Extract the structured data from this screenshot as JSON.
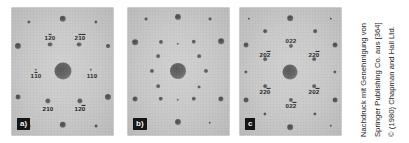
{
  "figure": {
    "background_color": "#ffffff",
    "panel_background_color": "#c8c8c8",
    "spot_color": "#4a4a4a",
    "label_color": "#151515",
    "panels": [
      {
        "id": "a",
        "tag": "a)",
        "caption_letter": "a",
        "has_labels": true,
        "labels": [
          {
            "text": "120",
            "overbar": "1",
            "x": 38,
            "y": 30
          },
          {
            "text": "210",
            "overbar": "21",
            "x": 68,
            "y": 30
          },
          {
            "text": "110",
            "overbar": "1",
            "x": 24,
            "y": 68
          },
          {
            "text": "110",
            "overbar": "",
            "x": 80,
            "y": 68
          },
          {
            "text": "210",
            "overbar": "",
            "x": 36,
            "y": 101
          },
          {
            "text": "120",
            "overbar": "2",
            "x": 68,
            "y": 101
          }
        ],
        "spots": [
          {
            "x": 50.5,
            "y": 63,
            "r": 8.5,
            "central": true
          },
          {
            "x": 17,
            "y": 14,
            "r": 1.6
          },
          {
            "x": 50.5,
            "y": 11,
            "r": 3.2
          },
          {
            "x": 84,
            "y": 14,
            "r": 1.6
          },
          {
            "x": 6,
            "y": 38,
            "r": 3.0
          },
          {
            "x": 38,
            "y": 36.5,
            "r": 2.4
          },
          {
            "x": 67,
            "y": 36.5,
            "r": 2.4
          },
          {
            "x": 96,
            "y": 38,
            "r": 1.9
          },
          {
            "x": 24,
            "y": 62,
            "r": 1.2
          },
          {
            "x": 79,
            "y": 62,
            "r": 1.2
          },
          {
            "x": 6,
            "y": 89,
            "r": 2.4
          },
          {
            "x": 36,
            "y": 93,
            "r": 2.6
          },
          {
            "x": 68,
            "y": 93,
            "r": 2.6
          },
          {
            "x": 96,
            "y": 89,
            "r": 3.0
          },
          {
            "x": 17,
            "y": 118,
            "r": 1.4
          },
          {
            "x": 50.5,
            "y": 117,
            "r": 3.2
          },
          {
            "x": 84,
            "y": 118,
            "r": 1.4
          }
        ]
      },
      {
        "id": "b",
        "tag": "b)",
        "caption_letter": "b",
        "has_labels": false,
        "labels": [],
        "spots": [
          {
            "x": 50,
            "y": 63,
            "r": 8.0,
            "central": true
          },
          {
            "x": 18,
            "y": 11,
            "r": 1.4
          },
          {
            "x": 50,
            "y": 9,
            "r": 3.0
          },
          {
            "x": 82,
            "y": 11,
            "r": 1.4
          },
          {
            "x": 7,
            "y": 34,
            "r": 2.8
          },
          {
            "x": 33,
            "y": 34,
            "r": 2.0
          },
          {
            "x": 50,
            "y": 36,
            "r": 1.2
          },
          {
            "x": 66,
            "y": 34,
            "r": 2.2
          },
          {
            "x": 93,
            "y": 33,
            "r": 2.8
          },
          {
            "x": 30,
            "y": 48,
            "r": 1.8
          },
          {
            "x": 71,
            "y": 48,
            "r": 1.8
          },
          {
            "x": 24,
            "y": 63,
            "r": 2.0
          },
          {
            "x": 78,
            "y": 63,
            "r": 2.0
          },
          {
            "x": 30,
            "y": 78,
            "r": 1.8
          },
          {
            "x": 71,
            "y": 79,
            "r": 1.4
          },
          {
            "x": 7,
            "y": 91,
            "r": 2.4
          },
          {
            "x": 33,
            "y": 91,
            "r": 2.2
          },
          {
            "x": 50,
            "y": 92,
            "r": 1.2
          },
          {
            "x": 66,
            "y": 91,
            "r": 2.2
          },
          {
            "x": 93,
            "y": 91,
            "r": 2.6
          },
          {
            "x": 18,
            "y": 115,
            "r": 1.2
          },
          {
            "x": 50,
            "y": 114,
            "r": 3.0
          },
          {
            "x": 82,
            "y": 115,
            "r": 1.2
          }
        ]
      },
      {
        "id": "c",
        "tag": "c",
        "caption_letter": "c",
        "has_labels": true,
        "labels": [
          {
            "text": "022",
            "overbar": "",
            "x": 51,
            "y": 33
          },
          {
            "text": "202",
            "overbar": "2",
            "x": 25,
            "y": 47
          },
          {
            "text": "220",
            "overbar": "2",
            "x": 74,
            "y": 47
          },
          {
            "text": "220",
            "overbar": "2",
            "x": 25,
            "y": 84
          },
          {
            "text": "202",
            "overbar": "2",
            "x": 74,
            "y": 84
          },
          {
            "text": "022",
            "overbar": "2",
            "x": 51,
            "y": 98
          }
        ],
        "spots": [
          {
            "x": 50,
            "y": 64,
            "r": 7.5,
            "central": true
          },
          {
            "x": 9,
            "y": 11,
            "r": 1.2
          },
          {
            "x": 50,
            "y": 10,
            "r": 2.8
          },
          {
            "x": 91,
            "y": 11,
            "r": 1.2
          },
          {
            "x": 25,
            "y": 23,
            "r": 1.8
          },
          {
            "x": 75,
            "y": 23,
            "r": 1.8
          },
          {
            "x": 6,
            "y": 37,
            "r": 2.4
          },
          {
            "x": 51,
            "y": 38,
            "r": 2.0
          },
          {
            "x": 95,
            "y": 37,
            "r": 2.4
          },
          {
            "x": 25,
            "y": 51,
            "r": 1.8
          },
          {
            "x": 74,
            "y": 51,
            "r": 1.8
          },
          {
            "x": 6,
            "y": 64,
            "r": 1.6
          },
          {
            "x": 95,
            "y": 64,
            "r": 1.6
          },
          {
            "x": 25,
            "y": 78,
            "r": 1.8
          },
          {
            "x": 74,
            "y": 78,
            "r": 1.8
          },
          {
            "x": 6,
            "y": 92,
            "r": 2.4
          },
          {
            "x": 51,
            "y": 92,
            "r": 2.0
          },
          {
            "x": 95,
            "y": 92,
            "r": 2.4
          },
          {
            "x": 25,
            "y": 106,
            "r": 1.6
          },
          {
            "x": 75,
            "y": 106,
            "r": 1.6
          },
          {
            "x": 9,
            "y": 118,
            "r": 1.2
          },
          {
            "x": 50,
            "y": 119,
            "r": 2.8
          },
          {
            "x": 91,
            "y": 118,
            "r": 1.2
          }
        ]
      }
    ]
  },
  "credit": {
    "line1": "Nachdruck mit Genehmigung von",
    "line2": "Springer Publishing Co. aus [364]",
    "line3": "© (1980) Chapman and Hall Ltd."
  }
}
